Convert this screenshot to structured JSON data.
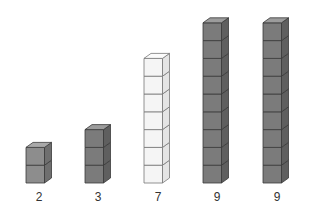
{
  "figure": {
    "colors": {
      "gray_front": "#7b7b7b",
      "gray_side": "#5f5f5f",
      "gray_top": "#9c9c9c",
      "light_gray_front": "#8d8d8d",
      "light_gray_side": "#6f6f6f",
      "light_gray_top": "#a9a9a9",
      "white_front": "#f5f5f5",
      "white_side": "#e4e4e4",
      "white_top": "#fbfbfb",
      "outline": "#3a3a3a",
      "white_outline": "#777777"
    },
    "stacks": [
      {
        "count": 2,
        "label": "2",
        "style": "light_gray",
        "x": 26
      },
      {
        "count": 3,
        "label": "3",
        "style": "gray",
        "x": 85
      },
      {
        "count": 7,
        "label": "7",
        "style": "white",
        "x": 144
      },
      {
        "count": 9,
        "label": "9",
        "style": "gray",
        "x": 203
      },
      {
        "count": 9,
        "label": "9",
        "style": "gray",
        "x": 263
      }
    ]
  }
}
